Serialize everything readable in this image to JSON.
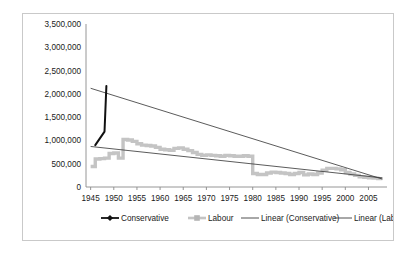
{
  "chart_data": {
    "type": "scatter",
    "title": "",
    "subtitle": "",
    "xlabel": "",
    "ylabel": "",
    "xlim": [
      1944,
      2009
    ],
    "ylim": [
      0,
      3500000
    ],
    "xticks": [
      1945,
      1950,
      1955,
      1960,
      1965,
      1970,
      1975,
      1980,
      1985,
      1990,
      1995,
      2000,
      2005
    ],
    "xtick_labels": [
      "1945",
      "1950",
      "1955",
      "1960",
      "1965",
      "1970",
      "1975",
      "1980",
      "1985",
      "1990",
      "1995",
      "2000",
      "2005"
    ],
    "yticks": [
      0,
      500000,
      1000000,
      1500000,
      2000000,
      2500000,
      3000000,
      3500000
    ],
    "ytick_labels": [
      "0",
      "500,000",
      "1,000,000",
      "1,500,000",
      "2,000,000",
      "2,500,000",
      "3,000,000",
      "3,500,000"
    ],
    "grid": false,
    "legend_position": "bottom",
    "colors": {
      "conservative": "#111111",
      "labour": "#c4c4c4",
      "linear_conservative": "#3d3d3d",
      "linear_labour": "#3d3d3d",
      "axis": "#8a8a8a",
      "frame": "#c9c9c9",
      "text": "#1a1a1a",
      "background": "#ffffff"
    },
    "series": [
      {
        "name": "Conservative",
        "marker": "diamond",
        "color": "#111111",
        "points": [
          [
            1946,
            900000
          ],
          [
            1948,
            1190000
          ],
          [
            1948.4,
            2170000
          ],
          [
            1951,
            2880000
          ],
          [
            1953,
            2780000
          ],
          [
            1965,
            2220000
          ],
          [
            1969,
            1100000
          ],
          [
            1970,
            1100000
          ],
          [
            1975,
            1100000
          ],
          [
            1982,
            1180000
          ],
          [
            1983,
            1180000
          ],
          [
            1984,
            1180000
          ],
          [
            1987,
            970000
          ],
          [
            1990,
            970000
          ],
          [
            1992,
            470000
          ],
          [
            1992.8,
            380000
          ],
          [
            1993,
            350000
          ],
          [
            2000,
            400000
          ],
          [
            2005,
            240000
          ],
          [
            2006,
            230000
          ],
          [
            2008,
            210000
          ]
        ]
      },
      {
        "name": "Labour",
        "marker": "square",
        "color": "#c4c4c4",
        "points": [
          [
            1945,
            440000
          ],
          [
            1946,
            600000
          ],
          [
            1947,
            610000
          ],
          [
            1948,
            620000
          ],
          [
            1949,
            720000
          ],
          [
            1950,
            730000
          ],
          [
            1951,
            620000
          ],
          [
            1952,
            1020000
          ],
          [
            1953,
            1010000
          ],
          [
            1954,
            980000
          ],
          [
            1955,
            930000
          ],
          [
            1956,
            900000
          ],
          [
            1957,
            890000
          ],
          [
            1958,
            880000
          ],
          [
            1959,
            850000
          ],
          [
            1960,
            810000
          ],
          [
            1961,
            800000
          ],
          [
            1962,
            790000
          ],
          [
            1963,
            830000
          ],
          [
            1964,
            840000
          ],
          [
            1965,
            810000
          ],
          [
            1966,
            780000
          ],
          [
            1967,
            740000
          ],
          [
            1968,
            700000
          ],
          [
            1969,
            680000
          ],
          [
            1970,
            690000
          ],
          [
            1971,
            680000
          ],
          [
            1972,
            670000
          ],
          [
            1973,
            660000
          ],
          [
            1974,
            680000
          ],
          [
            1975,
            670000
          ],
          [
            1976,
            660000
          ],
          [
            1977,
            660000
          ],
          [
            1978,
            670000
          ],
          [
            1979,
            660000
          ],
          [
            1980,
            290000
          ],
          [
            1981,
            270000
          ],
          [
            1982,
            270000
          ],
          [
            1983,
            300000
          ],
          [
            1984,
            320000
          ],
          [
            1985,
            310000
          ],
          [
            1986,
            300000
          ],
          [
            1987,
            290000
          ],
          [
            1988,
            270000
          ],
          [
            1989,
            290000
          ],
          [
            1990,
            310000
          ],
          [
            1991,
            260000
          ],
          [
            1992,
            280000
          ],
          [
            1993,
            270000
          ],
          [
            1994,
            300000
          ],
          [
            1995,
            360000
          ],
          [
            1996,
            400000
          ],
          [
            1997,
            400000
          ],
          [
            1998,
            390000
          ],
          [
            1999,
            370000
          ],
          [
            2000,
            310000
          ],
          [
            2001,
            280000
          ],
          [
            2002,
            250000
          ],
          [
            2003,
            220000
          ],
          [
            2004,
            210000
          ],
          [
            2005,
            200000
          ],
          [
            2006,
            190000
          ],
          [
            2007,
            180000
          ],
          [
            2008,
            180000
          ]
        ]
      }
    ],
    "trendlines": [
      {
        "name": "Linear (Conservative)",
        "color": "#3d3d3d",
        "x_start": 1945,
        "y_start": 2120000,
        "x_end": 2008,
        "y_end": 170000
      },
      {
        "name": "Linear (Labour)",
        "color": "#3d3d3d",
        "x_start": 1945,
        "y_start": 870000,
        "x_end": 2008,
        "y_end": 195000
      }
    ],
    "legend": [
      {
        "label": "Conservative",
        "type": "line-marker-diamond",
        "color": "#111111"
      },
      {
        "label": "Labour",
        "type": "line-marker-square",
        "color": "#c4c4c4"
      },
      {
        "label": "Linear (Conservative)",
        "type": "line",
        "color": "#3d3d3d"
      },
      {
        "label": "Linear (Labour)",
        "type": "line",
        "color": "#3d3d3d"
      }
    ]
  }
}
